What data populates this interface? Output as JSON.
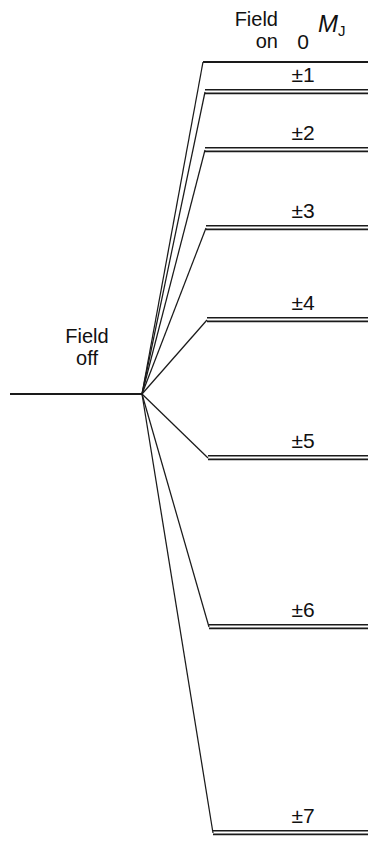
{
  "figure": {
    "background_color": "#ffffff",
    "line_color": "#1a1a1a",
    "width": 382,
    "height": 857
  },
  "headers": {
    "field_on_line1": "Field",
    "field_on_line2": "on",
    "mj_symbol": "M",
    "mj_subscript": "J"
  },
  "field_off": {
    "line1": "Field",
    "line2": "off"
  },
  "chart_data": {
    "type": "line",
    "xlabel": "",
    "ylabel": "Energy",
    "grid": false,
    "legend": "none",
    "origin": {
      "x": 142,
      "y": 394
    },
    "field_off_level": {
      "x_start": 10,
      "x_end": 142,
      "y": 394
    },
    "level_x_right": 368,
    "label_center_x": 303,
    "levels": [
      {
        "mj": "0",
        "label": "0",
        "y": 62,
        "x_left": 203,
        "doublet": false,
        "label_y": 30
      },
      {
        "mj": "1",
        "label": "±1",
        "y": 92,
        "x_left": 205,
        "doublet": true,
        "label_y": 63
      },
      {
        "mj": "2",
        "label": "±2",
        "y": 150,
        "x_left": 205,
        "doublet": true,
        "label_y": 121
      },
      {
        "mj": "3",
        "label": "±3",
        "y": 228,
        "x_left": 206,
        "doublet": true,
        "label_y": 199
      },
      {
        "mj": "4",
        "label": "±4",
        "y": 320,
        "x_left": 207,
        "doublet": true,
        "label_y": 291
      },
      {
        "mj": "5",
        "label": "±5",
        "y": 458,
        "x_left": 208,
        "doublet": true,
        "label_y": 429
      },
      {
        "mj": "6",
        "label": "±6",
        "y": 627,
        "x_left": 209,
        "doublet": true,
        "label_y": 598
      },
      {
        "mj": "7",
        "label": "±7",
        "y": 833,
        "x_left": 213,
        "doublet": true,
        "label_y": 804
      }
    ]
  }
}
